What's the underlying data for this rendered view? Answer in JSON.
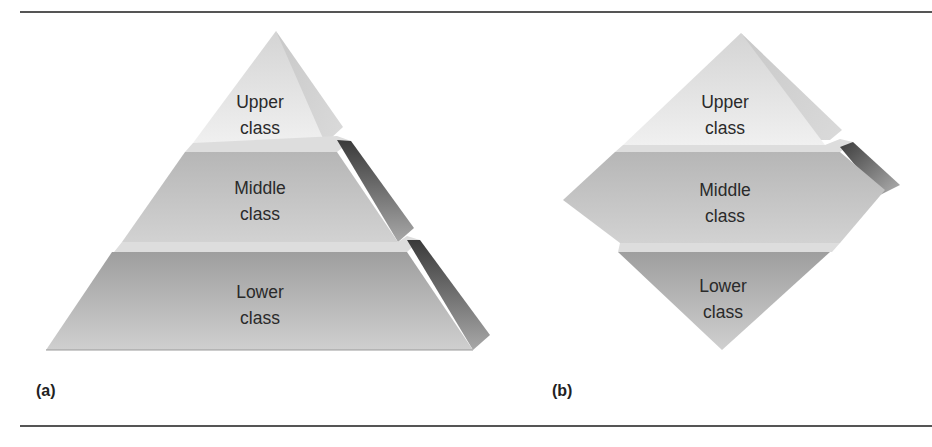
{
  "figure": {
    "panels": [
      {
        "id": "a",
        "label": "(a)",
        "shape": "pyramid",
        "tiers": [
          {
            "line1": "Upper",
            "line2": "class"
          },
          {
            "line1": "Middle",
            "line2": "class"
          },
          {
            "line1": "Lower",
            "line2": "class"
          }
        ]
      },
      {
        "id": "b",
        "label": "(b)",
        "shape": "diamond",
        "tiers": [
          {
            "line1": "Upper",
            "line2": "class"
          },
          {
            "line1": "Middle",
            "line2": "class"
          },
          {
            "line1": "Lower",
            "line2": "class"
          }
        ]
      }
    ]
  },
  "colors": {
    "upper_face": "#e8e8e8",
    "middle_face": "#c4c4c4",
    "lower_face": "#b2b2b2",
    "top_band": "#dcdcdc",
    "side_dark": "#4a4a4a",
    "text": "#2a2a2a",
    "rule": "#555555"
  }
}
